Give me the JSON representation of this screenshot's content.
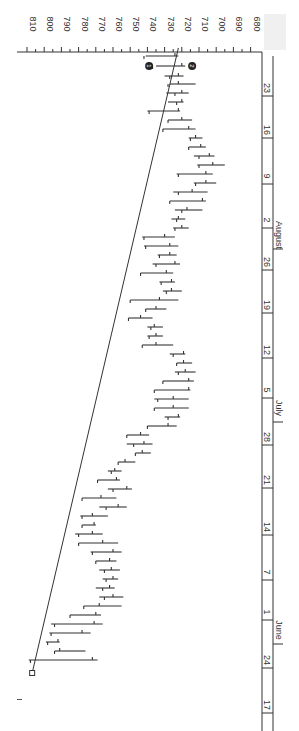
{
  "chart_data": {
    "type": "ohlc",
    "orientation": "rotated-90-clockwise",
    "title": "",
    "xlabel": "",
    "ylabel": "",
    "ylim": [
      680,
      810
    ],
    "price_ticks": [
      810,
      800,
      790,
      780,
      770,
      760,
      750,
      740,
      730,
      720,
      710,
      700,
      690,
      680
    ],
    "date_ticks": [
      {
        "label": "17",
        "y": 705
      },
      {
        "label": "24",
        "y": 660
      },
      {
        "label": "1",
        "y": 612
      },
      {
        "label": "7",
        "y": 572
      },
      {
        "label": "14",
        "y": 527
      },
      {
        "label": "21",
        "y": 480
      },
      {
        "label": "28",
        "y": 437
      },
      {
        "label": "5",
        "y": 390
      },
      {
        "label": "12",
        "y": 350
      },
      {
        "label": "19",
        "y": 305
      },
      {
        "label": "26",
        "y": 262
      },
      {
        "label": "2",
        "y": 220
      },
      {
        "label": "9",
        "y": 176
      },
      {
        "label": "16",
        "y": 130
      },
      {
        "label": "23",
        "y": 88
      }
    ],
    "months": [
      {
        "label": "June",
        "y": 630
      },
      {
        "label": "July",
        "y": 408
      },
      {
        "label": "August",
        "y": 235
      }
    ],
    "trendline": {
      "from": {
        "price": 807,
        "y": 673
      },
      "to": {
        "price": 722,
        "y": 48
      }
    },
    "markers": [
      {
        "label": "1",
        "price": 739,
        "y": 66
      },
      {
        "label": "2",
        "price": 714,
        "y": 66
      }
    ],
    "bars": [
      {
        "y": 56,
        "high": 741,
        "low": 722,
        "open": 742,
        "close": 724
      },
      {
        "y": 66,
        "high": 735,
        "low": 718,
        "open": 737,
        "close": 720
      },
      {
        "y": 76,
        "high": 730,
        "low": 719,
        "open": 727,
        "close": 722
      },
      {
        "y": 84,
        "high": 727,
        "low": 712,
        "open": 728,
        "close": 722
      },
      {
        "y": 93,
        "high": 729,
        "low": 716,
        "open": 724,
        "close": 720
      },
      {
        "y": 102,
        "high": 728,
        "low": 719,
        "open": 723,
        "close": 720
      },
      {
        "y": 111,
        "high": 740,
        "low": 721,
        "open": 739,
        "close": 722
      },
      {
        "y": 120,
        "high": 728,
        "low": 714,
        "open": 728,
        "close": 720
      },
      {
        "y": 129,
        "high": 731,
        "low": 712,
        "open": 731,
        "close": 716
      },
      {
        "y": 138,
        "high": 716,
        "low": 708,
        "open": 715,
        "close": 712
      },
      {
        "y": 147,
        "high": 716,
        "low": 706,
        "open": 716,
        "close": 709
      },
      {
        "y": 156,
        "high": 713,
        "low": 701,
        "open": 710,
        "close": 704
      },
      {
        "y": 165,
        "high": 711,
        "low": 695,
        "open": 710,
        "close": 702
      },
      {
        "y": 174,
        "high": 723,
        "low": 702,
        "open": 722,
        "close": 706
      },
      {
        "y": 183,
        "high": 713,
        "low": 700,
        "open": 712,
        "close": 706
      },
      {
        "y": 192,
        "high": 725,
        "low": 705,
        "open": 722,
        "close": 714
      },
      {
        "y": 201,
        "high": 727,
        "low": 706,
        "open": 727,
        "close": 708
      },
      {
        "y": 210,
        "high": 724,
        "low": 708,
        "open": 720,
        "close": 717
      },
      {
        "y": 219,
        "high": 726,
        "low": 718,
        "open": 723,
        "close": 722
      },
      {
        "y": 228,
        "high": 725,
        "low": 716,
        "open": 724,
        "close": 720
      },
      {
        "y": 237,
        "high": 743,
        "low": 724,
        "open": 742,
        "close": 730
      },
      {
        "y": 246,
        "high": 742,
        "low": 722,
        "open": 741,
        "close": 727
      },
      {
        "y": 255,
        "high": 734,
        "low": 723,
        "open": 733,
        "close": 727
      },
      {
        "y": 264,
        "high": 737,
        "low": 721,
        "open": 735,
        "close": 724
      },
      {
        "y": 273,
        "high": 744,
        "low": 725,
        "open": 744,
        "close": 729
      },
      {
        "y": 282,
        "high": 733,
        "low": 724,
        "open": 732,
        "close": 726
      },
      {
        "y": 291,
        "high": 731,
        "low": 720,
        "open": 729,
        "close": 726
      },
      {
        "y": 300,
        "high": 750,
        "low": 722,
        "open": 750,
        "close": 733
      },
      {
        "y": 309,
        "high": 741,
        "low": 729,
        "open": 741,
        "close": 735
      },
      {
        "y": 318,
        "high": 751,
        "low": 737,
        "open": 751,
        "close": 744
      },
      {
        "y": 327,
        "high": 740,
        "low": 731,
        "open": 738,
        "close": 736
      },
      {
        "y": 336,
        "high": 740,
        "low": 731,
        "open": 739,
        "close": 735
      },
      {
        "y": 345,
        "high": 743,
        "low": 725,
        "open": 743,
        "close": 735
      },
      {
        "y": 354,
        "high": 727,
        "low": 718,
        "open": 725,
        "close": 719
      },
      {
        "y": 363,
        "high": 723,
        "low": 714,
        "open": 723,
        "close": 719
      },
      {
        "y": 372,
        "high": 724,
        "low": 712,
        "open": 722,
        "close": 718
      },
      {
        "y": 381,
        "high": 731,
        "low": 713,
        "open": 731,
        "close": 716
      },
      {
        "y": 390,
        "high": 736,
        "low": 715,
        "open": 736,
        "close": 716
      },
      {
        "y": 399,
        "high": 736,
        "low": 716,
        "open": 734,
        "close": 725
      },
      {
        "y": 408,
        "high": 736,
        "low": 716,
        "open": 736,
        "close": 725
      },
      {
        "y": 417,
        "high": 730,
        "low": 721,
        "open": 728,
        "close": 722
      },
      {
        "y": 426,
        "high": 740,
        "low": 723,
        "open": 740,
        "close": 728
      },
      {
        "y": 435,
        "high": 752,
        "low": 739,
        "open": 752,
        "close": 744
      },
      {
        "y": 444,
        "high": 752,
        "low": 737,
        "open": 748,
        "close": 742
      },
      {
        "y": 453,
        "high": 747,
        "low": 738,
        "open": 747,
        "close": 743
      },
      {
        "y": 462,
        "high": 757,
        "low": 747,
        "open": 757,
        "close": 753
      },
      {
        "y": 471,
        "high": 763,
        "low": 755,
        "open": 761,
        "close": 759
      },
      {
        "y": 480,
        "high": 769,
        "low": 756,
        "open": 769,
        "close": 758
      },
      {
        "y": 489,
        "high": 763,
        "low": 749,
        "open": 760,
        "close": 752
      },
      {
        "y": 498,
        "high": 778,
        "low": 758,
        "open": 778,
        "close": 767
      },
      {
        "y": 507,
        "high": 768,
        "low": 752,
        "open": 764,
        "close": 757
      },
      {
        "y": 516,
        "high": 779,
        "low": 763,
        "open": 778,
        "close": 772
      },
      {
        "y": 525,
        "high": 778,
        "low": 770,
        "open": 778,
        "close": 771
      },
      {
        "y": 534,
        "high": 782,
        "low": 766,
        "open": 780,
        "close": 772
      },
      {
        "y": 543,
        "high": 780,
        "low": 757,
        "open": 780,
        "close": 766
      },
      {
        "y": 552,
        "high": 773,
        "low": 755,
        "open": 772,
        "close": 760
      },
      {
        "y": 561,
        "high": 770,
        "low": 758,
        "open": 770,
        "close": 762
      },
      {
        "y": 570,
        "high": 768,
        "low": 756,
        "open": 765,
        "close": 761
      },
      {
        "y": 579,
        "high": 766,
        "low": 757,
        "open": 764,
        "close": 760
      },
      {
        "y": 588,
        "high": 770,
        "low": 759,
        "open": 766,
        "close": 762
      },
      {
        "y": 597,
        "high": 768,
        "low": 754,
        "open": 765,
        "close": 760
      },
      {
        "y": 606,
        "high": 777,
        "low": 755,
        "open": 777,
        "close": 768
      },
      {
        "y": 615,
        "high": 785,
        "low": 767,
        "open": 785,
        "close": 770
      },
      {
        "y": 624,
        "high": 796,
        "low": 766,
        "open": 794,
        "close": 771
      },
      {
        "y": 633,
        "high": 797,
        "low": 773,
        "open": 796,
        "close": 778
      },
      {
        "y": 642,
        "high": 799,
        "low": 791,
        "open": 798,
        "close": 792
      },
      {
        "y": 651,
        "high": 794,
        "low": 776,
        "open": 794,
        "close": 791
      },
      {
        "y": 660,
        "high": 809,
        "low": 769,
        "open": 808,
        "close": 772
      }
    ]
  }
}
